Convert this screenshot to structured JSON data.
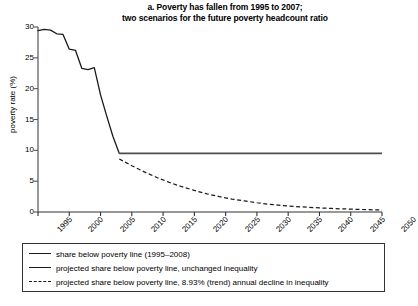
{
  "chart_data": {
    "type": "line",
    "title": "a. Poverty has fallen from 1995 to 2007; two scenarios for the future poverty headcount ratio",
    "title_lines": [
      "a. Poverty has fallen from 1995 to 2007;",
      "two scenarios for the future poverty headcount ratio"
    ],
    "xlabel": "",
    "ylabel": "poverty rate (%)",
    "xlim": [
      1995,
      2050
    ],
    "ylim": [
      0,
      30
    ],
    "yticks": [
      0,
      5,
      10,
      15,
      20,
      25,
      30
    ],
    "xticks": [
      1995,
      2000,
      2005,
      2010,
      2015,
      2020,
      2025,
      2030,
      2035,
      2040,
      2045,
      2050
    ],
    "grid": false,
    "legend_position": "below-axes",
    "series": [
      {
        "name": "share below poverty line (1995–2008)",
        "style": "solid",
        "color": "#1a1a1a",
        "x": [
          1995,
          1996,
          1997,
          1998,
          1999,
          2000,
          2001,
          2002,
          2003,
          2004,
          2005,
          2006,
          2007,
          2008
        ],
        "values": [
          29.4,
          29.6,
          29.5,
          28.9,
          28.8,
          26.4,
          26.2,
          23.3,
          23.1,
          23.4,
          19.0,
          15.5,
          12.2,
          9.5
        ]
      },
      {
        "name": "projected share below poverty line, unchanged inequality",
        "style": "solid",
        "color": "#4d4d4d",
        "x": [
          2008,
          2015,
          2020,
          2025,
          2030,
          2035,
          2040,
          2045,
          2050
        ],
        "values": [
          9.5,
          9.5,
          9.5,
          9.5,
          9.5,
          9.5,
          9.5,
          9.5,
          9.5
        ]
      },
      {
        "name": "projected share below poverty line, 8.93% (trend) annual decline in inequality",
        "style": "dashed",
        "color": "#1a1a1a",
        "x": [
          2008,
          2010,
          2012,
          2014,
          2016,
          2018,
          2020,
          2022,
          2024,
          2026,
          2028,
          2030,
          2032,
          2034,
          2036,
          2038,
          2040,
          2042,
          2044,
          2046,
          2048,
          2050
        ],
        "values": [
          8.6,
          7.5,
          6.5,
          5.6,
          4.8,
          4.1,
          3.5,
          2.95,
          2.5,
          2.1,
          1.8,
          1.5,
          1.25,
          1.05,
          0.9,
          0.78,
          0.66,
          0.57,
          0.5,
          0.43,
          0.37,
          0.32
        ]
      }
    ]
  },
  "legend": {
    "entries": [
      "share below poverty line (1995–2008)",
      "projected share below poverty line, unchanged inequality",
      "projected share below poverty line, 8.93% (trend) annual decline in inequality"
    ]
  }
}
